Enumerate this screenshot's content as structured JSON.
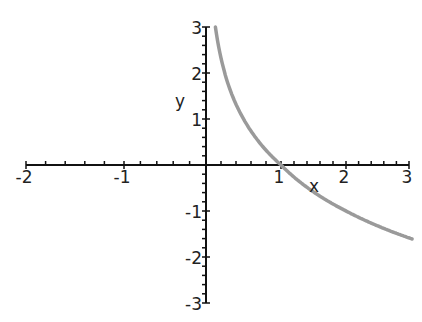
{
  "chart_data": {
    "type": "line",
    "title": "",
    "xlabel": "x",
    "ylabel": "y",
    "xlim": [
      -2,
      3
    ],
    "ylim": [
      -3,
      3
    ],
    "grid": false,
    "legend": null,
    "x_ticks": [
      "-2",
      "-1",
      "1",
      "2",
      "3"
    ],
    "y_ticks": [
      "3",
      "2",
      "1",
      "-1",
      "-2",
      "-3"
    ],
    "series": [
      {
        "name": "y = -log2(x)",
        "color": "#9a9a9a",
        "x": [
          0.125,
          0.2,
          0.3,
          0.5,
          0.75,
          1.0,
          1.5,
          2.0,
          2.5,
          3.0
        ],
        "y": [
          3.0,
          2.32,
          1.74,
          1.0,
          0.42,
          0.0,
          -0.58,
          -1.0,
          -1.32,
          -1.58
        ]
      }
    ]
  },
  "axes": {
    "x_label": "x",
    "y_label": "y",
    "x_tick_labels": [
      "-2",
      "-1",
      "1",
      "2",
      "3"
    ],
    "y_tick_labels": [
      "3",
      "2",
      "1",
      "-1",
      "-2",
      "-3"
    ],
    "axis_color": "#111111",
    "curve_color": "#9a9a9a"
  }
}
